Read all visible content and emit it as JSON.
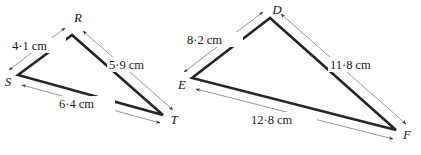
{
  "figure": {
    "background_color": "#ffffff",
    "edge_color": "#262626",
    "dimension_color": "#8a8a8a",
    "text_color": "#1a1a1a",
    "triangles": [
      {
        "name": "triangle-rst",
        "vertices": [
          {
            "label": "R",
            "x": 72,
            "y": 35
          },
          {
            "label": "S",
            "x": 18,
            "y": 75
          },
          {
            "label": "T",
            "x": 163,
            "y": 115
          }
        ],
        "sides": [
          {
            "name": "side-sr",
            "label": "4·1 cm",
            "value": 4.1,
            "unit": "cm",
            "from": "S",
            "to": "R"
          },
          {
            "name": "side-rt",
            "label": "5·9 cm",
            "value": 5.9,
            "unit": "cm",
            "from": "R",
            "to": "T"
          },
          {
            "name": "side-st",
            "label": "6·4 cm",
            "value": 6.4,
            "unit": "cm",
            "from": "S",
            "to": "T"
          }
        ]
      },
      {
        "name": "triangle-def",
        "vertices": [
          {
            "label": "D",
            "x": 270,
            "y": 18
          },
          {
            "label": "E",
            "x": 192,
            "y": 78
          },
          {
            "label": "F",
            "x": 396,
            "y": 130
          }
        ],
        "sides": [
          {
            "name": "side-ed",
            "label": "8·2 cm",
            "value": 8.2,
            "unit": "cm",
            "from": "E",
            "to": "D"
          },
          {
            "name": "side-df",
            "label": "11·8 cm",
            "value": 11.8,
            "unit": "cm",
            "from": "D",
            "to": "F"
          },
          {
            "name": "side-ef",
            "label": "12·8 cm",
            "value": 12.8,
            "unit": "cm",
            "from": "E",
            "to": "F"
          }
        ]
      }
    ],
    "labels": {
      "r": "R",
      "s": "S",
      "t": "T",
      "d": "D",
      "e": "E",
      "f": "F",
      "dim_sr": "4·1 cm",
      "dim_rt": "5·9 cm",
      "dim_st": "6·4 cm",
      "dim_ed": "8·2 cm",
      "dim_df": "11·8 cm",
      "dim_ef": "12·8 cm"
    }
  }
}
